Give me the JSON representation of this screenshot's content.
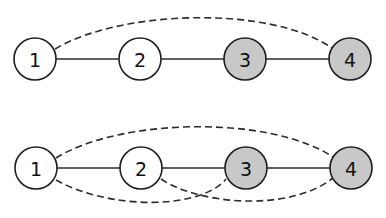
{
  "colors": {
    "white_node": "#ffffff",
    "gray_node": "#c8c8c8",
    "stroke": "#1e1e1e"
  },
  "graphs": [
    {
      "name": "top-graph",
      "nodes": [
        {
          "id": "1",
          "label": "1",
          "fill": "white"
        },
        {
          "id": "2",
          "label": "2",
          "fill": "white"
        },
        {
          "id": "3",
          "label": "3",
          "fill": "gray"
        },
        {
          "id": "4",
          "label": "4",
          "fill": "gray"
        }
      ],
      "solid_edges": [
        [
          "1",
          "2"
        ],
        [
          "2",
          "3"
        ],
        [
          "3",
          "4"
        ]
      ],
      "dashed_edges": [
        [
          "1",
          "4"
        ]
      ]
    },
    {
      "name": "bottom-graph",
      "nodes": [
        {
          "id": "1",
          "label": "1",
          "fill": "white"
        },
        {
          "id": "2",
          "label": "2",
          "fill": "white"
        },
        {
          "id": "3",
          "label": "3",
          "fill": "gray"
        },
        {
          "id": "4",
          "label": "4",
          "fill": "gray"
        }
      ],
      "solid_edges": [
        [
          "1",
          "2"
        ],
        [
          "2",
          "3"
        ],
        [
          "3",
          "4"
        ]
      ],
      "dashed_edges": [
        [
          "1",
          "4"
        ],
        [
          "1",
          "3"
        ],
        [
          "2",
          "4"
        ]
      ]
    }
  ]
}
